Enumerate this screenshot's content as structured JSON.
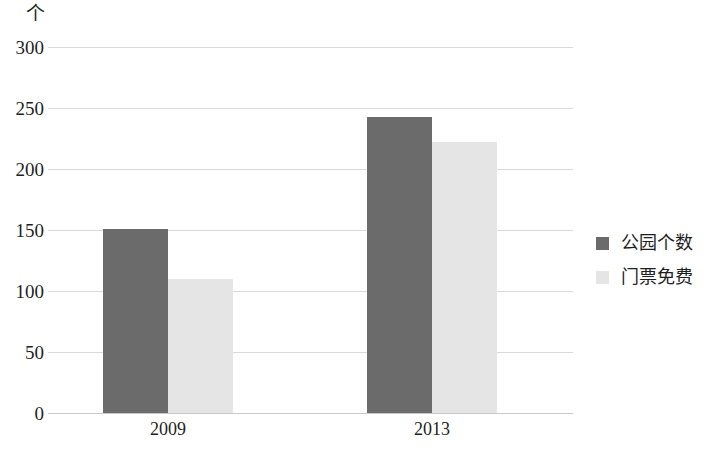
{
  "chart_data": {
    "type": "bar",
    "title": "",
    "subtitle": "",
    "unit_label": "个",
    "xlabel": "",
    "ylabel": "",
    "categories": [
      "2009",
      "2013"
    ],
    "series": [
      {
        "name": "公园个数",
        "color": "#6b6b6b",
        "values": [
          151,
          243
        ]
      },
      {
        "name": "门票免费",
        "color": "#e5e5e5",
        "values": [
          110,
          222
        ]
      }
    ],
    "ylim": [
      0,
      300
    ],
    "y_ticks": [
      0,
      50,
      100,
      150,
      200,
      250,
      300
    ],
    "y_tick_labels": [
      "0",
      "50",
      "100",
      "150",
      "200",
      "250",
      "300"
    ],
    "grid": true,
    "legend_position": "right",
    "annotations": []
  },
  "legend": {
    "items": [
      {
        "label": "公园个数",
        "swatch": "legend-swatch-dark"
      },
      {
        "label": "门票免费",
        "swatch": "legend-swatch-light"
      }
    ]
  },
  "colors": {
    "series_dark": "#6b6b6b",
    "series_light": "#e5e5e5",
    "gridline": "#d9d9d9",
    "text": "#1f1f1f",
    "background": "#ffffff"
  }
}
